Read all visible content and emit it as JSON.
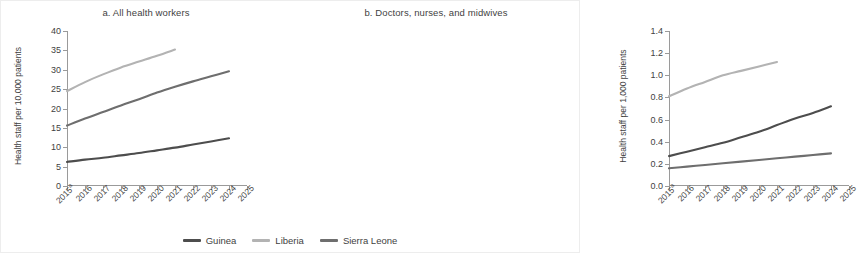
{
  "chart_data": [
    {
      "type": "line",
      "panel": "a",
      "title": "a. All health workers",
      "xlabel": "",
      "ylabel": "Health staff per 10,000 patients",
      "x": [
        "2015",
        "2016",
        "2017",
        "2018",
        "2019",
        "2020",
        "2021",
        "2022",
        "2023",
        "2024",
        "2025"
      ],
      "x_tick_labels": [
        "2015",
        "2016",
        "2017",
        "2018",
        "2019",
        "2020",
        "2021",
        "2022",
        "2023",
        "2024",
        "2025"
      ],
      "x_first_footnote": "a",
      "ylim": [
        0,
        40
      ],
      "y_ticks": [
        0,
        5,
        10,
        15,
        20,
        25,
        30,
        35,
        40
      ],
      "grid": false,
      "legend_position": "bottom",
      "series": [
        {
          "name": "Guinea",
          "color": "#4d4d4d",
          "values": [
            6.2,
            6.8,
            7.3,
            7.9,
            8.5,
            9.2,
            9.9,
            10.7,
            11.5,
            12.3,
            null
          ]
        },
        {
          "name": "Liberia",
          "color": "#b3b3b3",
          "values": [
            24.5,
            26.8,
            28.8,
            30.6,
            32.1,
            33.6,
            35.2,
            null,
            null,
            null,
            null
          ]
        },
        {
          "name": "Sierra Leone",
          "color": "#6e6e6e",
          "values": [
            15.6,
            17.4,
            19.1,
            20.8,
            22.4,
            24.1,
            25.6,
            27.0,
            28.3,
            29.6,
            null
          ]
        }
      ]
    },
    {
      "type": "line",
      "panel": "b",
      "title": "b. Doctors, nurses, and midwives",
      "xlabel": "",
      "ylabel": "Health staff per 1,000 patients",
      "x": [
        "2015",
        "2016",
        "2017",
        "2018",
        "2019",
        "2020",
        "2021",
        "2022",
        "2023",
        "2024",
        "2025"
      ],
      "x_tick_labels": [
        "2015",
        "2016",
        "2017",
        "2018",
        "2019",
        "2020",
        "2021",
        "2022",
        "2023",
        "2024",
        "2025"
      ],
      "x_first_footnote": "a",
      "ylim": [
        0.0,
        1.4
      ],
      "y_ticks": [
        0.0,
        0.2,
        0.4,
        0.6,
        0.8,
        1.0,
        1.2,
        1.4
      ],
      "grid": false,
      "legend_position": "bottom",
      "series": [
        {
          "name": "Guinea",
          "color": "#4d4d4d",
          "values": [
            0.27,
            0.31,
            0.35,
            0.39,
            0.44,
            0.49,
            0.55,
            0.61,
            0.66,
            0.72,
            null
          ]
        },
        {
          "name": "Liberia",
          "color": "#b3b3b3",
          "values": [
            0.81,
            0.88,
            0.94,
            1.0,
            1.04,
            1.08,
            1.12,
            null,
            null,
            null,
            null
          ]
        },
        {
          "name": "Sierra Leone",
          "color": "#6e6e6e",
          "values": [
            0.16,
            0.175,
            0.19,
            0.205,
            0.22,
            0.235,
            0.25,
            0.265,
            0.28,
            0.295,
            null
          ]
        }
      ]
    }
  ],
  "legend": {
    "items": [
      {
        "label": "Guinea",
        "color": "#4d4d4d"
      },
      {
        "label": "Liberia",
        "color": "#b3b3b3"
      },
      {
        "label": "Sierra Leone",
        "color": "#6e6e6e"
      }
    ]
  },
  "y_tick_labels": {
    "panel_a": [
      "0",
      "5",
      "10",
      "15",
      "20",
      "25",
      "30",
      "35",
      "40"
    ],
    "panel_b": [
      "0.0",
      "0.2",
      "0.4",
      "0.6",
      "0.8",
      "1.0",
      "1.2",
      "1.4"
    ]
  }
}
